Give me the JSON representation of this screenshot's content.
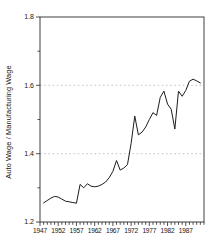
{
  "chart_data": {
    "type": "line",
    "title": "",
    "xlabel": "",
    "ylabel": "Auto Wage / Manufacturing Wage",
    "xlim": [
      1947,
      1992
    ],
    "ylim": [
      1.2,
      1.8
    ],
    "grid": "horizontal dashed gridlines",
    "grid_y": [
      1.4,
      1.6
    ],
    "legend": "none",
    "y_major_ticks": [
      1.2,
      1.4,
      1.6,
      1.8
    ],
    "y_minor_ticks": [
      1.3,
      1.5,
      1.7
    ],
    "x_label_ticks": [
      1947,
      1952,
      1957,
      1962,
      1967,
      1972,
      1977,
      1982,
      1987
    ],
    "x_minor_tick_step": 1,
    "line_color": "#1c1c1c",
    "series": [
      {
        "name": "auto-wage-to-manufacturing-wage-ratio",
        "x": [
          1948,
          1949,
          1950,
          1951,
          1952,
          1953,
          1954,
          1955,
          1956,
          1957,
          1958,
          1959,
          1960,
          1961,
          1962,
          1963,
          1964,
          1965,
          1966,
          1967,
          1968,
          1969,
          1970,
          1971,
          1972,
          1973,
          1974,
          1975,
          1976,
          1977,
          1978,
          1979,
          1980,
          1981,
          1982,
          1983,
          1984,
          1985,
          1986,
          1987,
          1988,
          1989,
          1990,
          1991
        ],
        "y": [
          1.256,
          1.263,
          1.27,
          1.275,
          1.273,
          1.267,
          1.261,
          1.259,
          1.257,
          1.255,
          1.31,
          1.3,
          1.312,
          1.305,
          1.303,
          1.305,
          1.31,
          1.317,
          1.33,
          1.348,
          1.38,
          1.352,
          1.358,
          1.368,
          1.43,
          1.51,
          1.455,
          1.463,
          1.478,
          1.5,
          1.52,
          1.512,
          1.565,
          1.583,
          1.545,
          1.53,
          1.472,
          1.583,
          1.568,
          1.585,
          1.612,
          1.618,
          1.613,
          1.607
        ]
      }
    ]
  }
}
